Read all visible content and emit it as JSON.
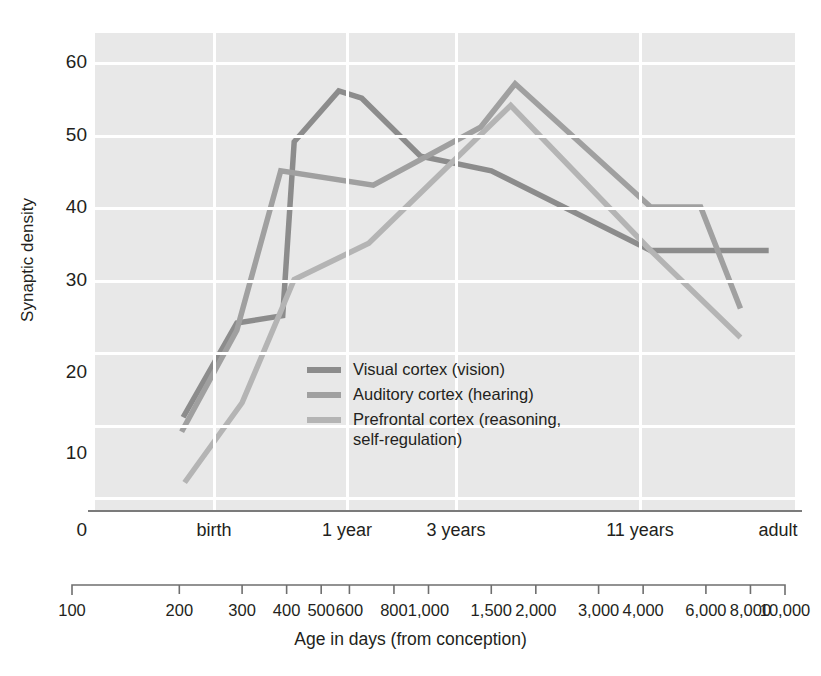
{
  "figure": {
    "y_axis_title": "Synaptic density",
    "x_axis_title": "Age in days (from conception)"
  },
  "y_axis": {
    "ticks": [
      "0",
      "10",
      "20",
      "30",
      "40",
      "50",
      "60"
    ],
    "min": 0,
    "max": 60,
    "step": 10
  },
  "era_labels": [
    {
      "text": "birth",
      "x": 214
    },
    {
      "text": "1 year",
      "x": 347
    },
    {
      "text": "3 years",
      "x": 456
    },
    {
      "text": "11 years",
      "x": 640
    },
    {
      "text": "adult",
      "x": 778
    }
  ],
  "x_scale": {
    "ticks": [
      "100",
      "200",
      "300",
      "400",
      "500",
      "600",
      "800",
      "1,000",
      "1,500",
      "2,000",
      "3,000",
      "4,000",
      "6,000",
      "8,000",
      "10,000"
    ],
    "tick_values": [
      100,
      200,
      300,
      400,
      500,
      600,
      800,
      1000,
      1500,
      2000,
      3000,
      4000,
      6000,
      8000,
      10000
    ],
    "log": true
  },
  "legend": {
    "position": "inside-center",
    "items": [
      {
        "label": "Visual cortex (vision)",
        "color": "#8c8c8c"
      },
      {
        "label": "Auditory cortex (hearing)",
        "color": "#a0a0a0"
      },
      {
        "label": "Prefrontal cortex (reasoning,",
        "label2": "self-regulation)",
        "color": "#b4b4b4"
      }
    ]
  },
  "colors": {
    "panel_background": "#e8e8e8",
    "gridline": "#ffffff",
    "axis_line": "#7b7b7b",
    "text": "#231f20",
    "visual": "#8c8c8c",
    "auditory": "#a0a0a0",
    "prefrontal": "#b4b4b4"
  },
  "chart_data": {
    "type": "line",
    "title": "",
    "xlabel": "Age in days (from conception)",
    "ylabel": "Synaptic density",
    "xlim": [
      100,
      10000
    ],
    "ylim": [
      0,
      60
    ],
    "xscale": "log",
    "grid": true,
    "x_tick_labels": [
      "100",
      "200",
      "300",
      "400",
      "500",
      "600",
      "800",
      "1,000",
      "1,500",
      "2,000",
      "3,000",
      "4,000",
      "6,000",
      "8,000",
      "10,000"
    ],
    "x_tick_values": [
      100,
      200,
      300,
      400,
      500,
      600,
      800,
      1000,
      1500,
      2000,
      3000,
      4000,
      6000,
      8000,
      10000
    ],
    "y_tick_labels": [
      "0",
      "10",
      "20",
      "30",
      "40",
      "50",
      "60"
    ],
    "era_markers": [
      {
        "label": "birth",
        "days": 280
      },
      {
        "label": "1 year",
        "days": 640
      },
      {
        "label": "3 years",
        "days": 1370
      },
      {
        "label": "11 years",
        "days": 4300
      },
      {
        "label": "adult",
        "days": 10000
      }
    ],
    "series": [
      {
        "name": "Visual cortex (vision)",
        "color": "#8c8c8c",
        "points": [
          {
            "x": 205,
            "y": 11
          },
          {
            "x": 290,
            "y": 24
          },
          {
            "x": 390,
            "y": 25
          },
          {
            "x": 420,
            "y": 49
          },
          {
            "x": 560,
            "y": 56
          },
          {
            "x": 650,
            "y": 55
          },
          {
            "x": 950,
            "y": 47
          },
          {
            "x": 1500,
            "y": 45
          },
          {
            "x": 4200,
            "y": 34
          },
          {
            "x": 9000,
            "y": 34
          }
        ]
      },
      {
        "name": "Auditory cortex (hearing)",
        "color": "#a0a0a0",
        "points": [
          {
            "x": 203,
            "y": 9
          },
          {
            "x": 290,
            "y": 23
          },
          {
            "x": 385,
            "y": 45
          },
          {
            "x": 700,
            "y": 43
          },
          {
            "x": 1400,
            "y": 51
          },
          {
            "x": 1750,
            "y": 57
          },
          {
            "x": 4200,
            "y": 40
          },
          {
            "x": 5800,
            "y": 40
          },
          {
            "x": 7500,
            "y": 26
          }
        ]
      },
      {
        "name": "Prefrontal cortex (reasoning, self-regulation)",
        "color": "#b4b4b4",
        "points": [
          {
            "x": 207,
            "y": 2
          },
          {
            "x": 300,
            "y": 13
          },
          {
            "x": 420,
            "y": 30
          },
          {
            "x": 680,
            "y": 35
          },
          {
            "x": 1700,
            "y": 54
          },
          {
            "x": 4200,
            "y": 34
          },
          {
            "x": 7500,
            "y": 22
          }
        ]
      }
    ]
  }
}
